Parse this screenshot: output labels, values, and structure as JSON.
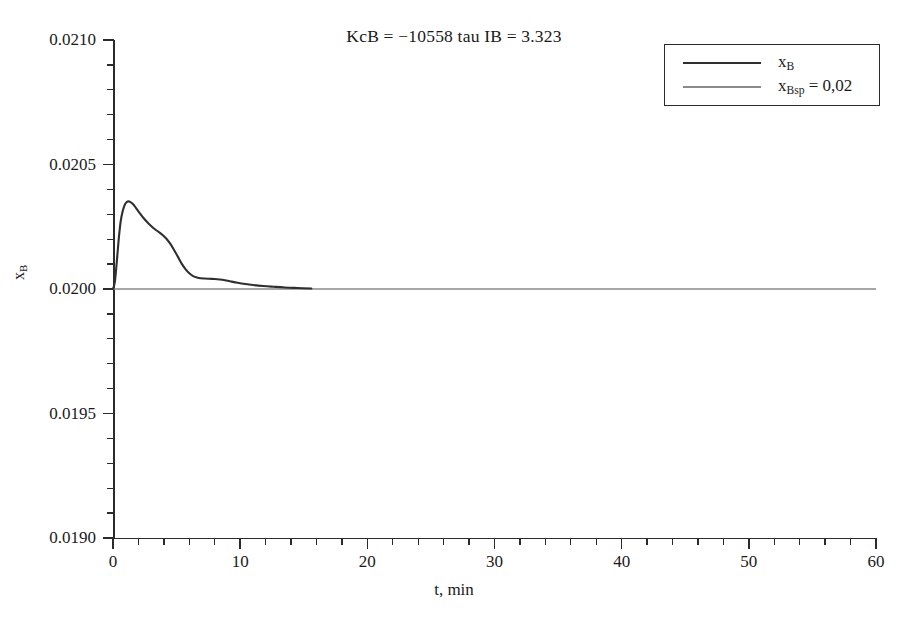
{
  "chart_data": {
    "type": "line",
    "title": "KcB = −10558 tau IB = 3.323",
    "xlabel": "t, min",
    "ylabel": "x_B",
    "xlim": [
      0,
      60
    ],
    "ylim": [
      0.019,
      0.021
    ],
    "grid": false,
    "legend_position": "top-right",
    "x_ticks": [
      0,
      10,
      20,
      30,
      40,
      50,
      60
    ],
    "x_tick_labels": [
      "0",
      "10",
      "20",
      "30",
      "40",
      "50",
      "60"
    ],
    "x_minor_step": 2,
    "y_ticks": [
      0.019,
      0.0195,
      0.02,
      0.0205,
      0.021
    ],
    "y_tick_labels": [
      "0.0190",
      "0.0195",
      "0.0200",
      "0.0205",
      "0.0210"
    ],
    "y_minor_step": 0.0001,
    "series": [
      {
        "name": "x_B",
        "legend_label": "x",
        "legend_sub": "B",
        "color": "#2f2f2f",
        "width": 2.1,
        "x": [
          0,
          0.15,
          0.3,
          0.45,
          0.6,
          0.75,
          0.9,
          1.05,
          1.2,
          1.35,
          1.5,
          1.7,
          1.9,
          2.1,
          2.4,
          2.7,
          3.0,
          3.3,
          3.6,
          3.9,
          4.2,
          4.5,
          4.8,
          5.1,
          5.4,
          5.7,
          6.0,
          6.3,
          6.6,
          6.9,
          7.2,
          7.6,
          8.0,
          8.4,
          8.8,
          9.2,
          9.8,
          10.4,
          11.0,
          11.8,
          12.6,
          13.5,
          14.5,
          15.6
        ],
        "y": [
          0.02,
          0.02003,
          0.02011,
          0.0202,
          0.02027,
          0.02031,
          0.020335,
          0.020348,
          0.020352,
          0.02035,
          0.020344,
          0.020333,
          0.020319,
          0.020305,
          0.020285,
          0.020268,
          0.020253,
          0.02024,
          0.020229,
          0.020217,
          0.020202,
          0.020182,
          0.020157,
          0.02013,
          0.020102,
          0.02008,
          0.020063,
          0.020052,
          0.020046,
          0.020043,
          0.020042,
          0.020041,
          0.02004,
          0.020038,
          0.020035,
          0.020031,
          0.020025,
          0.02002,
          0.020016,
          0.020012,
          0.020009,
          0.020006,
          0.020004,
          0.020002
        ]
      },
      {
        "name": "x_Bsp",
        "legend_label": "x",
        "legend_sub": "Bsp",
        "legend_suffix": " = 0,02",
        "color": "#8a8a8a",
        "width": 1.5,
        "constant_value": 0.02,
        "x": [
          0,
          60
        ],
        "y": [
          0.02,
          0.02
        ]
      }
    ],
    "annotations": []
  },
  "legend": {
    "entries": [
      {
        "label_main": "x",
        "label_sub": "B",
        "label_suffix": ""
      },
      {
        "label_main": "x",
        "label_sub": "Bsp",
        "label_suffix": " = 0,02"
      }
    ]
  },
  "axes": {
    "y_title_main": "x",
    "y_title_sub": "B",
    "x_title": "t, min"
  }
}
